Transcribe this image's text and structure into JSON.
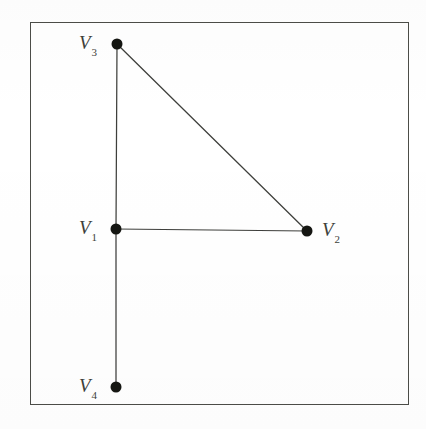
{
  "figure": {
    "background_color": "#ffffff",
    "ink_color": "#2a2b27",
    "frame": {
      "x": 30,
      "y": 22,
      "width": 379,
      "height": 383,
      "stroke_color": "#33342f",
      "stroke_width": 1
    }
  },
  "graph_data": {
    "type": "node-link-diagram",
    "vertices": [
      {
        "id": "V1",
        "label": "V",
        "subscript": "1",
        "x": 116,
        "y": 229,
        "label_x": 79,
        "label_y": 218,
        "label_side": "left"
      },
      {
        "id": "V2",
        "label": "V",
        "subscript": "2",
        "x": 307,
        "y": 231,
        "label_x": 322,
        "label_y": 220,
        "label_side": "right"
      },
      {
        "id": "V3",
        "label": "V",
        "subscript": "3",
        "x": 117,
        "y": 44,
        "label_x": 79,
        "label_y": 33,
        "label_side": "left"
      },
      {
        "id": "V4",
        "label": "V",
        "subscript": "4",
        "x": 116,
        "y": 387,
        "label_x": 79,
        "label_y": 376,
        "label_side": "left"
      }
    ],
    "edges": [
      {
        "id": "e-v3-v1",
        "from": "V3",
        "to": "V1",
        "x1": 117,
        "y1": 44,
        "x2": 116,
        "y2": 229
      },
      {
        "id": "e-v1-v4",
        "from": "V1",
        "to": "V4",
        "x1": 116,
        "y1": 229,
        "x2": 116,
        "y2": 387
      },
      {
        "id": "e-v1-v2",
        "from": "V1",
        "to": "V2",
        "x1": 116,
        "y1": 229,
        "x2": 307,
        "y2": 231
      },
      {
        "id": "e-v3-v2",
        "from": "V3",
        "to": "V2",
        "x1": 117,
        "y1": 44,
        "x2": 307,
        "y2": 231
      }
    ],
    "vertex_radius": 5.5,
    "vertex_fill": "#151612",
    "edge_count": 4,
    "vertex_count": 4
  }
}
